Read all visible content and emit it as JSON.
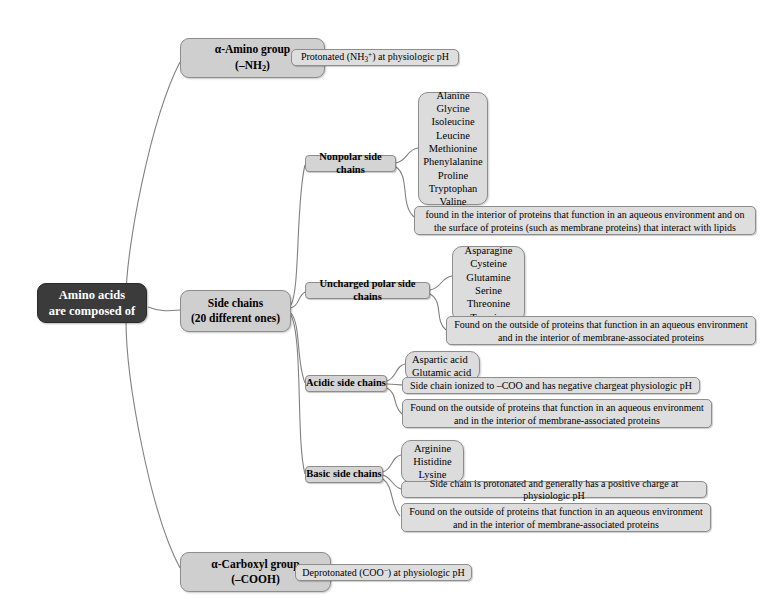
{
  "diagram": {
    "title": "Amino acids are composed of",
    "root": {
      "line1": "Amino acids",
      "line2": "are composed of"
    },
    "branches": {
      "amino_group": {
        "line1": "α-Amino group",
        "line2": "(–NH2)",
        "detail": "Protonated (NH3+) at physiologic pH"
      },
      "side_chains": {
        "line1": "Side chains",
        "line2": "(20 different ones)"
      },
      "carboxyl_group": {
        "line1": "α-Carboxyl group",
        "line2": "(–COOH)",
        "detail": "Deprotonated (COO-) at physiologic pH"
      }
    },
    "categories": [
      {
        "id": "nonpolar",
        "label": "Nonpolar side chains",
        "members": [
          "Alanine",
          "Glycine",
          "Isoleucine",
          "Leucine",
          "Methionine",
          "Phenylalanine",
          "Proline",
          "Tryptophan",
          "Valine"
        ],
        "notes": [
          "found in the interior of proteins that function in an aqueous environment and on the surface of proteins (such as membrane proteins) that interact with lipids"
        ]
      },
      {
        "id": "uncharged-polar",
        "label": "Uncharged polar side chains",
        "members": [
          "Asparagine",
          "Cysteine",
          "Glutamine",
          "Serine",
          "Threonine",
          "Tyrosine"
        ],
        "notes": [
          "Found on the outside of proteins that function in an aqueous environment and in the interior of membrane-associated proteins"
        ]
      },
      {
        "id": "acidic",
        "label": "Acidic side chains",
        "members": [
          "Aspartic acid",
          "Glutamic acid"
        ],
        "notes": [
          "Side chain ionized to –COO and has negative chargeat physiologic pH",
          "Found on the outside of proteins that function in an aqueous environment and in the interior of membrane-associated proteins"
        ]
      },
      {
        "id": "basic",
        "label": "Basic side chains",
        "members": [
          "Arginine",
          "Histidine",
          "Lysine"
        ],
        "notes": [
          "Side chain is protonated and generally has a positive charge at physiologic pH",
          "Found on the outside of proteins that function in an aqueous environment and in the interior of membrane-associated proteins"
        ]
      }
    ],
    "colors": {
      "root_fill": "#3b3b3b",
      "root_text": "#ffffff",
      "node_fill": "#d2d2d2",
      "node_border": "#8d8d8d",
      "connector": "#7a7a7a",
      "background": "#ffffff"
    }
  }
}
